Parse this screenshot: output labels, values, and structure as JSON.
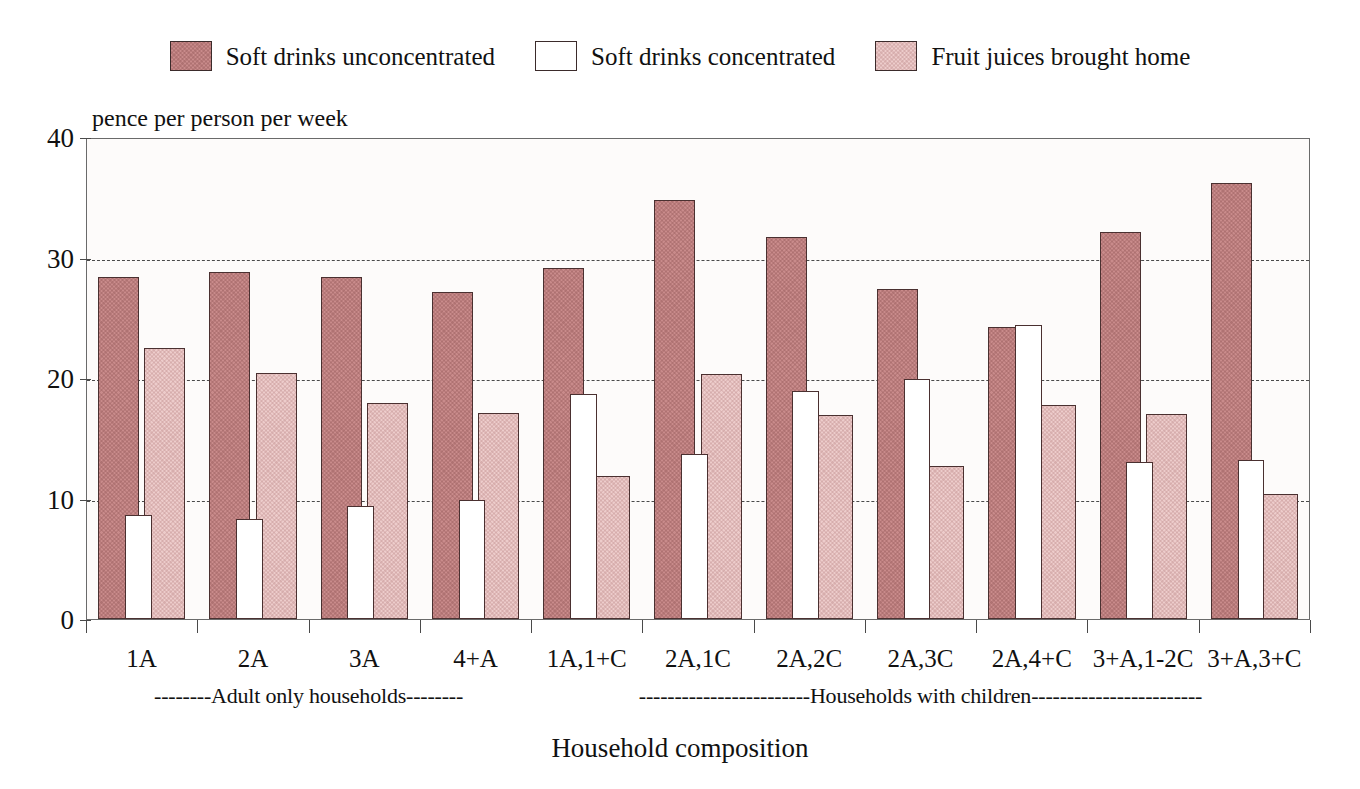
{
  "chart_data": {
    "type": "bar",
    "title": "",
    "xlabel": "Household composition",
    "ylabel": "pence per person per week",
    "ylim": [
      0,
      40
    ],
    "yticks": [
      0,
      10,
      20,
      30,
      40
    ],
    "grid": true,
    "legend_position": "top-center",
    "categories": [
      "1A",
      "2A",
      "3A",
      "4+A",
      "1A,1+C",
      "2A,1C",
      "2A,2C",
      "2A,3C",
      "2A,4+C",
      "3+A,1-2C",
      "3+A,3+C"
    ],
    "series": [
      {
        "name": "Soft drinks unconcentrated",
        "color": "#c98b8b",
        "values": [
          28.4,
          28.8,
          28.4,
          27.1,
          29.1,
          34.8,
          31.7,
          27.4,
          24.2,
          32.1,
          36.2
        ]
      },
      {
        "name": "Soft drinks concentrated",
        "color": "#ffffff",
        "values": [
          8.6,
          8.3,
          9.4,
          9.9,
          18.7,
          13.7,
          18.9,
          19.9,
          24.4,
          13.0,
          13.2
        ]
      },
      {
        "name": "Fruit juices brought home",
        "color": "#edcccb",
        "values": [
          22.5,
          20.4,
          17.9,
          17.1,
          11.9,
          20.3,
          16.9,
          12.7,
          17.8,
          17.0,
          10.4
        ]
      }
    ],
    "annotations": [
      {
        "text": "--------Adult only households--------",
        "span": [
          "1A",
          "4+A"
        ]
      },
      {
        "text": "------------------------Households with children------------------------",
        "span": [
          "1A,1+C",
          "3+A,3+C"
        ]
      }
    ]
  },
  "legend": {
    "items": [
      {
        "label": "Soft drinks unconcentrated",
        "swatch": "fill-dark"
      },
      {
        "label": "Soft drinks concentrated",
        "swatch": "fill-white"
      },
      {
        "label": "Fruit juices brought home",
        "swatch": "fill-light"
      }
    ]
  }
}
